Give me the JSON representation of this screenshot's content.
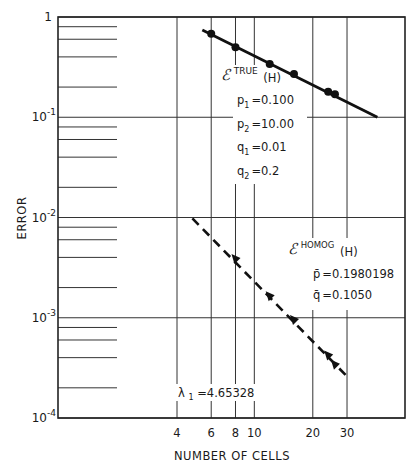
{
  "chart_data": {
    "type": "line",
    "title": "",
    "xlabel": "NUMBER OF CELLS",
    "ylabel": "ERROR",
    "xscale": "log",
    "yscale": "log",
    "xlim": [
      2,
      40
    ],
    "ylim": [
      0.0001,
      1
    ],
    "grid": true,
    "x_ticks": [
      4,
      6,
      8,
      10,
      20,
      30
    ],
    "x_tick_labels": [
      "4",
      "6",
      "8",
      "10",
      "20",
      "30"
    ],
    "y_ticks": [
      1,
      0.1,
      0.01,
      0.001,
      0.0001
    ],
    "y_tick_labels": [
      {
        "base": "1",
        "exp": ""
      },
      {
        "base": "10",
        "exp": "-1"
      },
      {
        "base": "10",
        "exp": "-2"
      },
      {
        "base": "10",
        "exp": "-3"
      },
      {
        "base": "10",
        "exp": "-4"
      }
    ],
    "y_minor_fractions": [
      0.8,
      0.6,
      0.4,
      0.2
    ],
    "series": [
      {
        "name": "E_TRUE(H)",
        "marker": "circle",
        "linestyle": "solid",
        "x": [
          6,
          8,
          12,
          16,
          24,
          26
        ],
        "y": [
          0.68,
          0.5,
          0.34,
          0.27,
          0.18,
          0.17
        ],
        "fit_line": {
          "x": [
            5.4,
            43
          ],
          "y": [
            0.74,
            0.1
          ]
        }
      },
      {
        "name": "E_HOMOG(H)",
        "marker": "triangle",
        "linestyle": "dashed",
        "x": [
          8,
          12,
          16,
          24,
          26
        ],
        "y": [
          0.00385,
          0.00164,
          0.00095,
          0.00042,
          0.00034
        ],
        "fit_line": {
          "x": [
            4.8,
            30
          ],
          "y": [
            0.0098,
            0.00026
          ]
        }
      }
    ],
    "annotations": {
      "true_label": {
        "script": "ℰ",
        "sup": "TRUE",
        "suffix": "(H)"
      },
      "true_params": [
        {
          "name": "p",
          "sub": "1",
          "value": "=0.100"
        },
        {
          "name": "p",
          "sub": "2",
          "value": "=10.00"
        },
        {
          "name": "q",
          "sub": "1",
          "value": "=0.01"
        },
        {
          "name": "q",
          "sub": "2",
          "value": "=0.2"
        }
      ],
      "homog_label": {
        "script": "ℰ",
        "sup": "HOMOG",
        "suffix": "(H)"
      },
      "homog_params": [
        {
          "name": "p̄",
          "value": "=0.1980198"
        },
        {
          "name": "q̄",
          "value": "=0.1050"
        }
      ],
      "lambda": {
        "name": "λ",
        "sub": "1",
        "value": "=4.65328"
      }
    }
  }
}
